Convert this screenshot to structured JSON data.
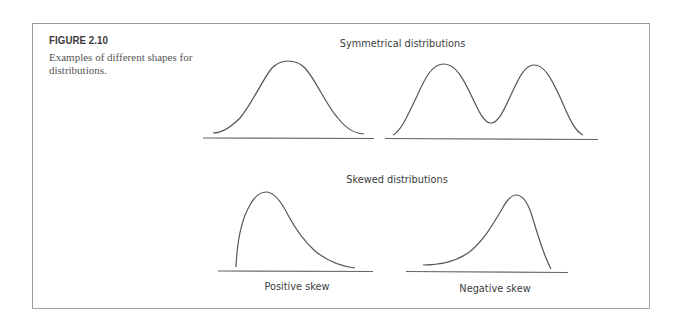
{
  "figure": {
    "label": "FIGURE 2.10",
    "caption": "Examples of different shapes for distributions."
  },
  "sections": [
    {
      "title": "Symmetrical distributions",
      "panels": [
        {
          "shape": "unimodal-normal",
          "label": ""
        },
        {
          "shape": "bimodal",
          "label": ""
        }
      ]
    },
    {
      "title": "Skewed distributions",
      "panels": [
        {
          "shape": "positive-skew",
          "label": "Positive skew"
        },
        {
          "shape": "negative-skew",
          "label": "Negative skew"
        }
      ]
    }
  ],
  "colors": {
    "curve": "#555555",
    "axis": "#666666",
    "frame": "#9a9a9a",
    "text": "#3c3c3c"
  }
}
